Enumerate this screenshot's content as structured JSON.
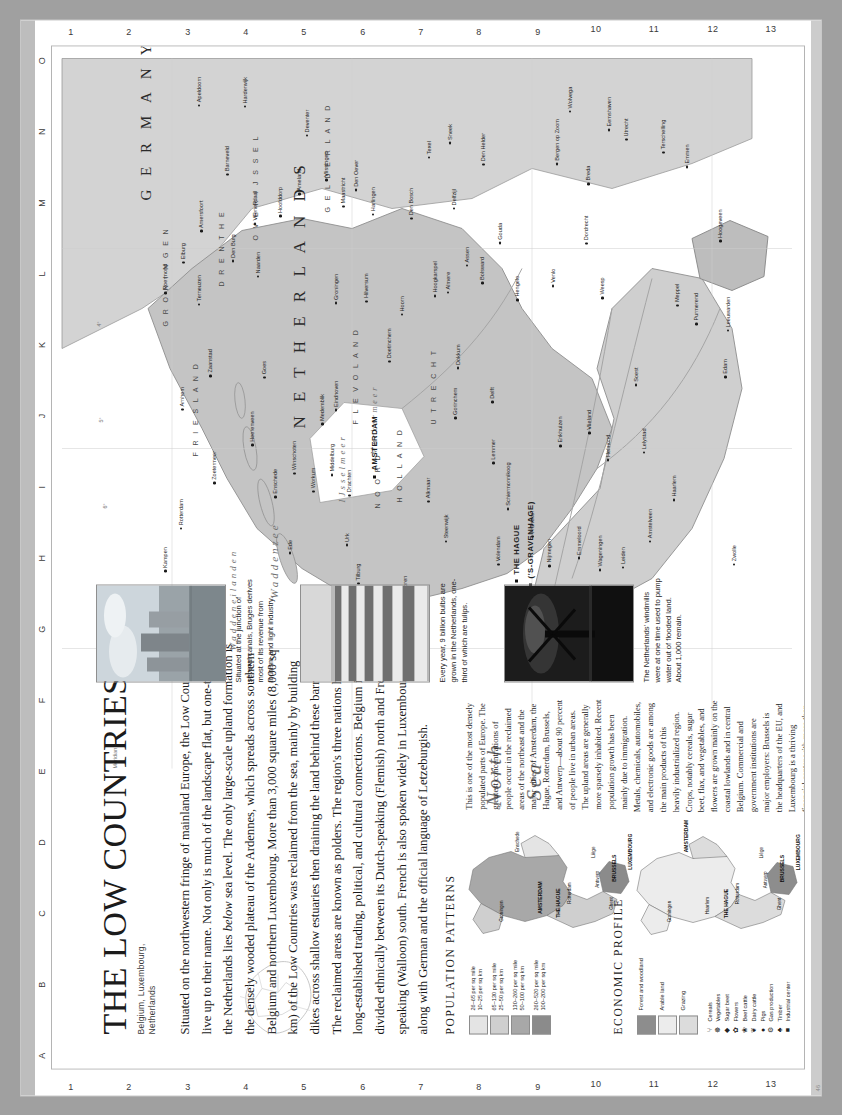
{
  "page": {
    "title_main": "THE LOW COUNTRIES",
    "title_lead": "T",
    "subtitle_line1": "Belgium, Luxembourg,",
    "subtitle_line2": "Netherlands",
    "credit": "46"
  },
  "intro": {
    "part1": "Situated on the northwestern fringe of mainland Europe, the Low Countries live up to their name. Not only is much of the landscape flat, but one-third of the Netherlands lies ",
    "emph": "below",
    "part2": " sea level. The only large-scale upland formation is the densely wooded plateau of the Ardennes, which spreads across southern Belgium and northern Luxembourg. More than 3,000 square miles (8,000 sq km) of the Low Countries was reclaimed from the sea, mainly by building dikes across shallow estuaries then draining the land behind these barriers. The reclaimed areas are known as polders. The region's three nations have long-established trading, political, and cultural connections. Belgium is divided ethnically between its Dutch-speaking (Flemish) north and French-speaking (Walloon) south. French is also spoken widely in Luxembourg, along with German and the official language of Letzeburgish."
  },
  "population_panel": {
    "heading": "POPULATION PATTERNS",
    "body": "This is one of the most densely populated parts of Europe. The greatest concentrations of people occur in the reclaimed areas of the northeast and the major cities of Amsterdam, the Hague, Rotterdam, Brussels, and Antwerp—about 90 percent of people live in urban areas. The upland areas are generally more sparsely inhabited. Recent population growth has been mainly due to immigration.",
    "legend": [
      {
        "color": "#e4e4e4",
        "line1": "26–65 per sq mile",
        "line2": "10–25 per sq km"
      },
      {
        "color": "#cfcfcf",
        "line1": "65–130 per sq mile",
        "line2": "25–50 per sq km"
      },
      {
        "color": "#a8a8a8",
        "line1": "130–260 per sq mile",
        "line2": "50–100 per sq km"
      },
      {
        "color": "#8b8b8b",
        "line1": "260–520 per sq mile",
        "line2": "100–200 per sq km"
      }
    ],
    "inset_labels": [
      "Groningen",
      "Enschede",
      "AMSTERDAM",
      "THE HAGUE",
      "Rotterdam",
      "Antwerp",
      "Ghent",
      "BRUSSELS",
      "Liège",
      "LUXEMBOURG"
    ]
  },
  "economic_panel": {
    "heading": "ECONOMIC PROFILE",
    "body": "Metals, chemicals, automobiles, and electronic goods are among the main products of this heavily industrialized region. Crops, notably cereals, sugar beet, flax, and vegetables, and flowers are grown mainly on the coastal lowlands and in central Belgium. Commercial and government institutions are major employers: Brussels is the headquarters of the EU, and Luxembourg is a thriving financial center with more than 160 banks.",
    "land_legend": [
      {
        "color": "#8d8d8d",
        "label": "Forest and woodland"
      },
      {
        "color": "#ececec",
        "label": "Arable land"
      },
      {
        "color": "#dcdcdc",
        "label": "Grazing"
      }
    ],
    "symbol_legend": [
      {
        "glyph": "⑂",
        "label": "Cereals"
      },
      {
        "glyph": "☸",
        "label": "Vegetables"
      },
      {
        "glyph": "◆",
        "label": "Sugar beet"
      },
      {
        "glyph": "✿",
        "label": "Flowers"
      },
      {
        "glyph": "❀",
        "label": "Beef cattle"
      },
      {
        "glyph": "❦",
        "label": "Dairy cattle"
      },
      {
        "glyph": "●",
        "label": "Pigs"
      },
      {
        "glyph": "⚙",
        "label": "Gas production"
      },
      {
        "glyph": "♣",
        "label": "Timber"
      },
      {
        "glyph": "■",
        "label": "Industrial center"
      }
    ],
    "inset_labels": [
      "Groningen",
      "AMSTERDAM",
      "Haarlem",
      "THE HAGUE",
      "Rotterdam",
      "Antwerp",
      "Ghent",
      "BRUSSELS",
      "Liège",
      "LUXEMBOURG"
    ]
  },
  "photos": [
    {
      "name": "bruges-canal-photo",
      "caption": "Situated at the junction of several canals, Bruges derives most of its revenue from tourism and light industry."
    },
    {
      "name": "tulip-fields-photo",
      "caption": "Every year, 9 billion bulbs are grown in the Netherlands, one-third of which are tulips."
    },
    {
      "name": "windmill-photo",
      "caption": "The Netherlands' windmills were at one time used to pump water out of flooded land. About 1,000 remain."
    }
  ],
  "grid": {
    "letters": [
      "A",
      "B",
      "C",
      "D",
      "E",
      "F",
      "G",
      "H",
      "I",
      "J",
      "K",
      "L",
      "M",
      "N",
      "O"
    ],
    "numbers": [
      "1",
      "2",
      "3",
      "4",
      "5",
      "6",
      "7",
      "8",
      "9",
      "10",
      "11",
      "12",
      "13"
    ]
  },
  "map": {
    "sea_labels": [
      {
        "text": "North",
        "x": 262,
        "y": 430,
        "size": 21,
        "rot": 0
      },
      {
        "text": "Sea",
        "x": 268,
        "y": 470,
        "size": 21,
        "rot": 0
      },
      {
        "text": "Waddenzee",
        "x": 470,
        "y": 216,
        "size": 11,
        "rot": 0
      },
      {
        "text": "Wadden​eilanden",
        "x": 418,
        "y": 176,
        "size": 9,
        "rot": 0
      },
      {
        "text": "IJsselmeer",
        "x": 566,
        "y": 285,
        "size": 9,
        "rot": 0
      },
      {
        "text": "Markermeer",
        "x": 614,
        "y": 318,
        "size": 8,
        "rot": 0
      }
    ],
    "countries": [
      {
        "text": "N E T H E R L A N D S",
        "x": 640,
        "y": 238,
        "size": 17
      },
      {
        "text": "G E R M A N Y",
        "x": 868,
        "y": 86,
        "size": 15
      }
    ],
    "provinces": [
      {
        "text": "G R O N I N G E N",
        "x": 742,
        "y": 110
      },
      {
        "text": "D R E N T H E",
        "x": 782,
        "y": 166
      },
      {
        "text": "F R I E S L A N D",
        "x": 612,
        "y": 140
      },
      {
        "text": "O V E R I J S S E L",
        "x": 828,
        "y": 200
      },
      {
        "text": "G E L D E R L A N D",
        "x": 856,
        "y": 272
      },
      {
        "text": "F L E V O L A N D",
        "x": 644,
        "y": 300
      },
      {
        "text": "N O O R D",
        "x": 560,
        "y": 322
      },
      {
        "text": "H O L L A N D",
        "x": 566,
        "y": 344
      },
      {
        "text": "U T R E C H T",
        "x": 644,
        "y": 378
      }
    ],
    "capitals": [
      {
        "text": "AMSTERDAM",
        "x": 598,
        "y": 318
      },
      {
        "text": "THE HAGUE",
        "x": 494,
        "y": 460
      },
      {
        "text": "('S-GRAVENHAGE)",
        "x": 490,
        "y": 474
      }
    ],
    "cities": [
      "Groningen",
      "Leeuwarden",
      "Assen",
      "Emmen",
      "Zwolle",
      "Enschede",
      "Apeldoorn",
      "Arnhem",
      "Nijmegen",
      "Utrecht",
      "Amersfoort",
      "Almere",
      "Haarlem",
      "Leiden",
      "Rotterdam",
      "Dordrecht",
      "Breda",
      "Tilburg",
      "Eindhoven",
      "Maastricht",
      "Den Helder",
      "Alkmaar",
      "Hoorn",
      "Lelystad",
      "Hilversum",
      "Gouda",
      "Delft",
      "Zoetermeer",
      "Zaanstad",
      "Hoofddorp",
      "Amstelveen",
      "Hengelo",
      "Deventer",
      "Doetinchem",
      "Venlo",
      "Roermond",
      "Helmond",
      "Den Bosch",
      "Gorinchem",
      "Middelburg",
      "Vlissingen",
      "Terneuzen",
      "Bergen op Zoom",
      "Goes",
      "Harlingen",
      "Stavoren",
      "Lemmer",
      "Meppel",
      "Hoogeveen",
      "Winschoten",
      "Delfzijl",
      "Eemshaven",
      "Texel",
      "Vlieland",
      "Terschelling",
      "Ameland",
      "Schiermonnikoog",
      "Den Burg",
      "Den Oever",
      "Enkhuizen",
      "Medemblik",
      "Hoogkarspel",
      "Purmerend",
      "Edam",
      "Volendam",
      "Naarden",
      "Weesp",
      "Soest",
      "Veenendaal",
      "Ede",
      "Wageningen",
      "Barneveld",
      "Harderwijk",
      "Elburg",
      "Kampen",
      "Steenwijk",
      "Heerenveen",
      "Drachten",
      "Dokkum",
      "Wolvega",
      "Emmeloord",
      "Urk",
      "Workum",
      "Bolsward",
      "Franeker",
      "Sneek"
    ],
    "coord_labels": [
      "7°",
      "6°",
      "5°",
      "4°",
      "53°",
      "52°",
      "51°",
      "Meridian"
    ]
  }
}
